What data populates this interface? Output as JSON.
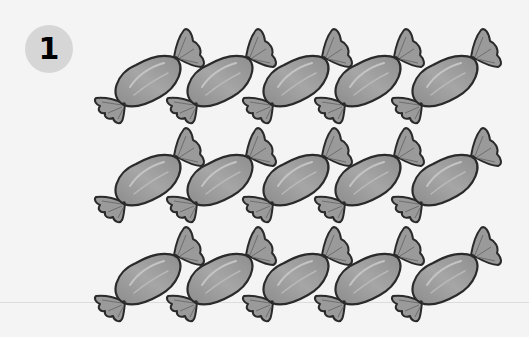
{
  "badge": {
    "number": "1",
    "color": "#d6d6d6"
  },
  "candies": {
    "icon": "wrapped-candy-icon",
    "rows": 3,
    "columns": 5,
    "total": 15,
    "fill_color": "#9a9a9a",
    "outline_color": "#2a2a2a"
  }
}
